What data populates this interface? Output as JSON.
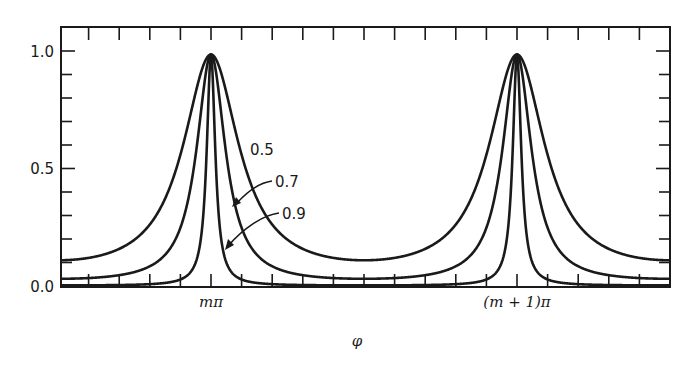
{
  "chart_data": {
    "type": "line",
    "title": "",
    "xlabel": "φ",
    "ylabel": "",
    "ylim": [
      0.0,
      1.0
    ],
    "yticks": [
      "0.0",
      "0.5",
      "1.0"
    ],
    "xtick_labels": [
      {
        "label": "mπ",
        "phase": 0
      },
      {
        "label": "(m + 1)π",
        "phase": 3.14159
      }
    ],
    "function": "T = 1 / (1 + F sin^2(φ)), F = 4R/(1-R)^2",
    "series": [
      {
        "name": "0.5",
        "R": 0.5,
        "peak": 1.0,
        "min": 0.11
      },
      {
        "name": "0.7",
        "R": 0.7,
        "peak": 1.0,
        "min": 0.03
      },
      {
        "name": "0.9",
        "R": 0.9,
        "peak": 1.0,
        "min": 0.003
      }
    ],
    "annotations": [
      "0.5",
      "0.7",
      "0.9"
    ],
    "grid": false,
    "legend": "inline labels with arrows"
  },
  "labels": {
    "y_0": "0.0",
    "y_05": "0.5",
    "y_1": "1.0",
    "x_m": "mπ",
    "x_m1": "(m + 1)π",
    "x_axis": "φ",
    "c05": "0.5",
    "c07": "0.7",
    "c09": "0.9"
  }
}
